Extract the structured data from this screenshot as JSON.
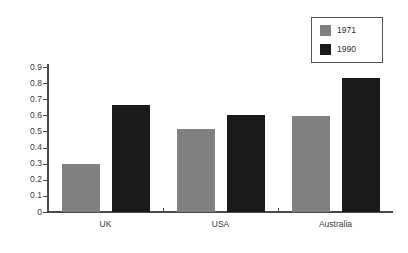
{
  "chart_data": {
    "type": "bar",
    "title": "",
    "subtitle": "",
    "xlabel": "",
    "ylabel": "",
    "categories": [
      "UK",
      "USA",
      "Australia"
    ],
    "series": [
      {
        "name": "1971",
        "color": "#808080",
        "values": [
          0.3,
          0.515,
          0.595
        ]
      },
      {
        "name": "1990",
        "color": "#1a1a1a",
        "values": [
          0.665,
          0.605,
          0.83
        ]
      }
    ],
    "ylim": [
      0,
      0.9
    ],
    "ytick_labels": [
      "0.9",
      "0.8",
      "0.7",
      "0.6",
      "0.5",
      "0.4",
      "0.3",
      "0.2",
      "0.1",
      "0"
    ],
    "ytick_values": [
      0.9,
      0.8,
      0.7,
      0.6,
      0.5,
      0.4,
      0.3,
      0.2,
      0.1,
      0
    ],
    "grid": false,
    "legend_position": "top-right",
    "legend_entries": [
      "1971",
      "1990"
    ],
    "background_color": "#ffffff",
    "axis_color": "#4a4a4a"
  }
}
